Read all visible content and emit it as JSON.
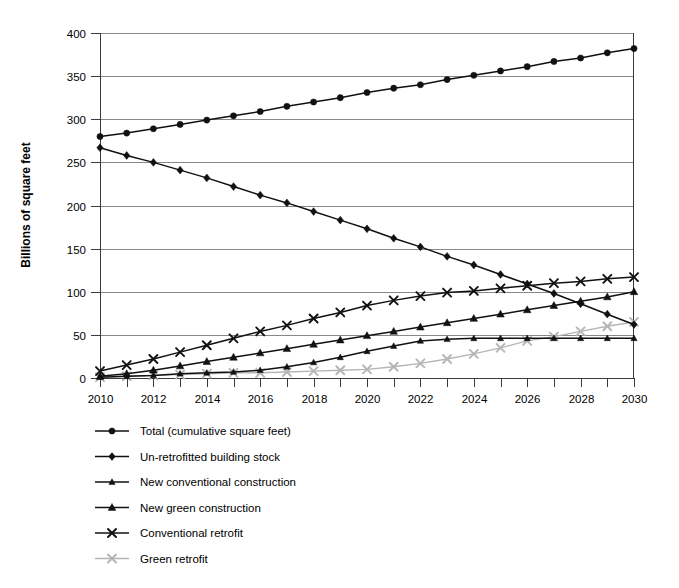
{
  "chart_data": {
    "type": "line",
    "title": "",
    "xlabel": "",
    "ylabel": "Billions of square feet",
    "xlim": [
      2010,
      2030
    ],
    "ylim": [
      0,
      400
    ],
    "ytick_step": 50,
    "xtick_step": 1,
    "xtick_label_step": 2,
    "grid": true,
    "legend_position": "bottom-left",
    "yticks": [
      0,
      50,
      100,
      150,
      200,
      250,
      300,
      350,
      400
    ],
    "ytick_labels": [
      "0",
      "50",
      "100",
      "150",
      "200",
      "250",
      "300",
      "350",
      "400"
    ],
    "x": [
      2010,
      2011,
      2012,
      2013,
      2014,
      2015,
      2016,
      2017,
      2018,
      2019,
      2020,
      2021,
      2022,
      2023,
      2024,
      2025,
      2026,
      2027,
      2028,
      2029,
      2030
    ],
    "xtick_labels": [
      "2010",
      "",
      "2012",
      "",
      "2014",
      "",
      "2016",
      "",
      "2018",
      "",
      "2020",
      "",
      "2022",
      "",
      "2024",
      "",
      "2026",
      "",
      "2028",
      "",
      "2030"
    ],
    "series": [
      {
        "name": "Total (cumulative square feet)",
        "marker": "circle",
        "color": "#111111",
        "values": [
          280,
          284,
          289,
          294,
          299,
          304,
          309,
          315,
          320,
          325,
          331,
          336,
          340,
          346,
          351,
          356,
          361,
          367,
          371,
          377,
          382
        ]
      },
      {
        "name": "Un-retrofitted building stock",
        "marker": "diamond",
        "color": "#111111",
        "values": [
          267,
          258,
          250,
          241,
          232,
          222,
          212,
          203,
          193,
          183,
          173,
          162,
          152,
          141,
          131,
          120,
          109,
          98,
          86,
          74,
          62
        ]
      },
      {
        "name": "New conventional construction",
        "marker": "triangle-small",
        "color": "#111111",
        "values": [
          1,
          2,
          3,
          5,
          6,
          7,
          9,
          13,
          18,
          24,
          31,
          37,
          43,
          45,
          46,
          46,
          46,
          46,
          46,
          46,
          46
        ]
      },
      {
        "name": "New green construction",
        "marker": "triangle",
        "color": "#111111",
        "values": [
          2,
          5,
          9,
          14,
          19,
          24,
          29,
          34,
          39,
          44,
          49,
          54,
          59,
          64,
          69,
          74,
          79,
          84,
          89,
          94,
          100
        ]
      },
      {
        "name": "Conventional retrofit",
        "marker": "cross-x",
        "color": "#111111",
        "values": [
          8,
          15,
          22,
          30,
          38,
          46,
          54,
          61,
          69,
          76,
          84,
          90,
          95,
          99,
          101,
          104,
          107,
          110,
          112,
          115,
          117
        ]
      },
      {
        "name": "Green retrofit",
        "marker": "cross-x",
        "color": "#b5b5b5",
        "values": [
          1,
          2,
          3,
          4,
          5,
          6,
          6,
          7,
          8,
          9,
          10,
          13,
          17,
          22,
          28,
          35,
          43,
          48,
          54,
          60,
          65
        ]
      }
    ]
  },
  "legend": {
    "items": [
      {
        "label": "Total (cumulative square feet)"
      },
      {
        "label": "Un-retrofitted building stock"
      },
      {
        "label": "New conventional construction"
      },
      {
        "label": "New green construction"
      },
      {
        "label": "Conventional retrofit"
      },
      {
        "label": "Green retrofit"
      }
    ]
  }
}
